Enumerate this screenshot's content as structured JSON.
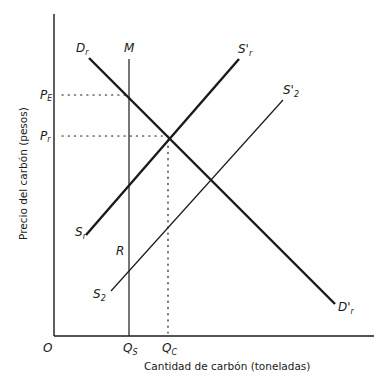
{
  "diagram": {
    "x_axis_label": "Cantidad de carbón (toneladas)",
    "y_axis_label": "Precio del carbón (pesos)",
    "origin_label": "O",
    "price_labels": [
      {
        "main": "P",
        "sub": "E"
      },
      {
        "main": "P",
        "sub": "r"
      }
    ],
    "quantity_labels": [
      {
        "main": "Q",
        "sub": "S"
      },
      {
        "main": "Q",
        "sub": "C"
      }
    ],
    "curves": {
      "demand": {
        "start": {
          "main": "D",
          "sub": "r"
        },
        "end": {
          "main": "D'",
          "sub": "r"
        }
      },
      "supply_1": {
        "start": {
          "main": "S",
          "sub": "r"
        },
        "end": {
          "main": "S'",
          "sub": "r"
        }
      },
      "supply_2": {
        "start": {
          "main": "S",
          "sub": "2"
        },
        "end": {
          "main": "S'",
          "sub": "2"
        }
      },
      "vertical": {
        "label": "M"
      },
      "region_label": "R"
    },
    "colors": {
      "ink": "#1a1a1a"
    }
  }
}
